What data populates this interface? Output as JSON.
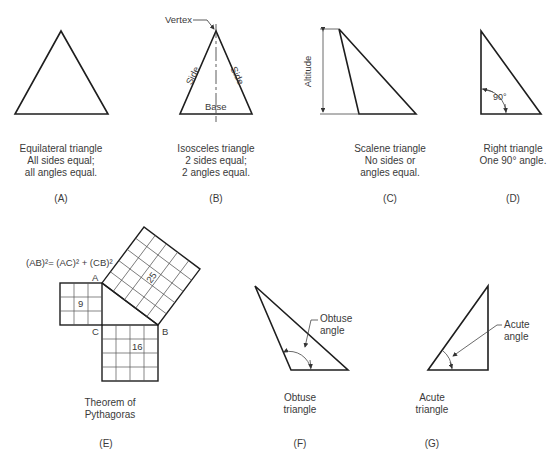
{
  "panels": [
    {
      "id": "A",
      "letter": "(A)",
      "caption": [
        "Equilateral triangle",
        "All sides equal;",
        "all angles equal."
      ]
    },
    {
      "id": "B",
      "letter": "(B)",
      "caption": [
        "Isosceles triangle",
        "2 sides equal;",
        "2 angles equal."
      ],
      "labels": {
        "vertex": "Vertex",
        "side_left": "Side",
        "side_right": "Side",
        "base": "Base"
      }
    },
    {
      "id": "C",
      "letter": "(C)",
      "caption": [
        "Scalene triangle",
        "No sides or",
        "angles equal."
      ],
      "labels": {
        "altitude": "Altitude"
      }
    },
    {
      "id": "D",
      "letter": "(D)",
      "caption": [
        "Right triangle",
        "One 90° angle."
      ],
      "labels": {
        "angle": "90°"
      }
    },
    {
      "id": "E",
      "letter": "(E)",
      "caption": [
        "Theorem of",
        "Pythagoras"
      ],
      "labels": {
        "formula": "(AB)²= (AC)² + (CB)²",
        "A": "A",
        "B": "B",
        "C": "C",
        "sq_ac": "9",
        "sq_cb": "16",
        "sq_ab": "25"
      }
    },
    {
      "id": "F",
      "letter": "(F)",
      "caption": [
        "Obtuse",
        "triangle"
      ],
      "labels": {
        "angle": [
          "Obtuse",
          "angle"
        ]
      }
    },
    {
      "id": "G",
      "letter": "(G)",
      "caption": [
        "Acute",
        "triangle"
      ],
      "labels": {
        "angle": [
          "Acute",
          "angle"
        ]
      }
    }
  ],
  "colors": {
    "line": "#1e1e1e",
    "text": "#3a3a3a",
    "grid": "#555555"
  }
}
